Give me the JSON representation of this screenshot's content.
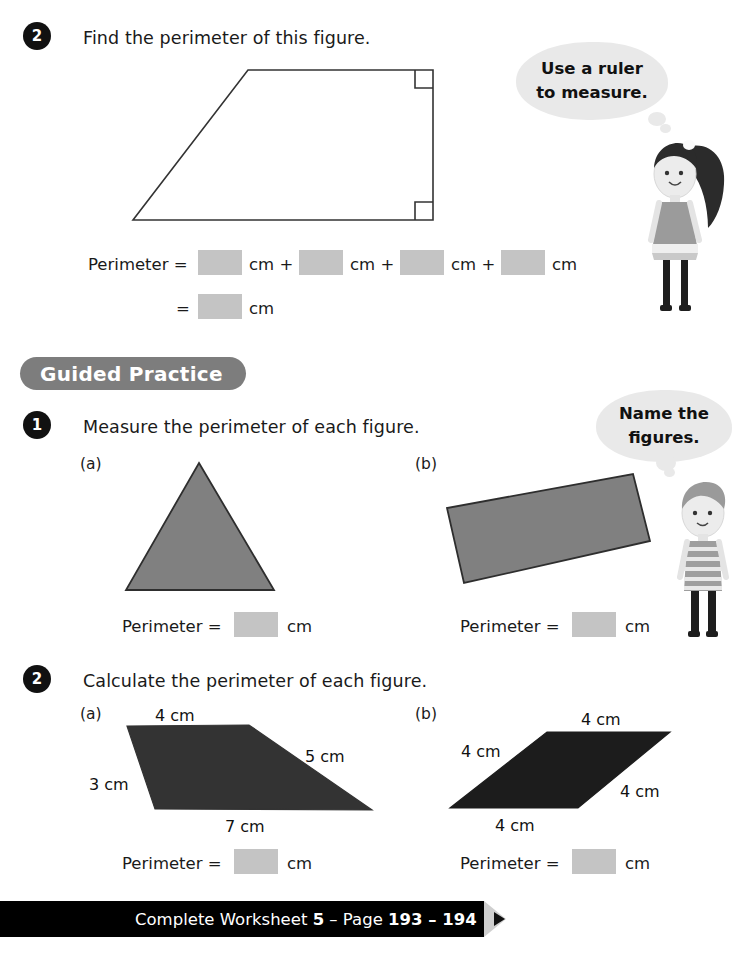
{
  "page": {
    "width": 754,
    "height": 970,
    "background": "#ffffff"
  },
  "colors": {
    "badge": "#111111",
    "pill": "#7d7d7d",
    "blank": "#c4c4c4",
    "shape_light_gray": "#808080",
    "shape_dark_gray": "#333333",
    "bubble": "#e9e9e9",
    "banner": "#000000",
    "banner_arrow": "#cfcfcf"
  },
  "question_2_top": {
    "badge": "2",
    "prompt": "Find the perimeter of this figure.",
    "figure": {
      "name": "right-trapezoid-outline",
      "fill": "none",
      "stroke": "#333333",
      "right_angle_marks": 2
    },
    "perimeter_line_1": {
      "label": "Perimeter =",
      "units": [
        "cm +",
        "cm +",
        "cm +",
        "cm"
      ],
      "blanks": 4,
      "blank_values": [
        "",
        "",
        "",
        ""
      ]
    },
    "perimeter_line_2": {
      "label": "=",
      "unit": "cm",
      "blanks": 1,
      "blank_values": [
        ""
      ]
    },
    "speech_bubble": {
      "line1": "Use a ruler",
      "line2": "to measure."
    },
    "character": "girl-with-ponytail"
  },
  "guided_practice": {
    "title": "Guided Practice"
  },
  "question_1": {
    "badge": "1",
    "prompt": "Measure the perimeter of each figure.",
    "speech_bubble": {
      "line1": "Name the",
      "line2": "figures."
    },
    "character": "boy-with-striped-shirt",
    "parts": [
      {
        "label": "(a)",
        "figure": "filled-triangle",
        "fill": "#808080",
        "perimeter_label": "Perimeter =",
        "unit": "cm",
        "blank_value": ""
      },
      {
        "label": "(b)",
        "figure": "tilted-filled-rectangle",
        "fill": "#808080",
        "perimeter_label": "Perimeter =",
        "unit": "cm",
        "blank_value": ""
      }
    ]
  },
  "question_2_bottom": {
    "badge": "2",
    "prompt": "Calculate the perimeter of each figure.",
    "parts": [
      {
        "label": "(a)",
        "figure": "filled-trapezoid",
        "fill": "#333333",
        "side_labels": {
          "top": "4 cm",
          "right": "5 cm",
          "left": "3 cm",
          "bottom": "7 cm"
        },
        "perimeter_label": "Perimeter =",
        "unit": "cm",
        "blank_value": ""
      },
      {
        "label": "(b)",
        "figure": "filled-rhombus",
        "fill": "#1c1c1c",
        "side_labels": {
          "top": "4 cm",
          "left": "4 cm",
          "right": "4 cm",
          "bottom": "4 cm"
        },
        "perimeter_label": "Perimeter =",
        "unit": "cm",
        "blank_value": ""
      }
    ]
  },
  "footer_banner": {
    "prefix": "Complete Worksheet ",
    "worksheet_number": "5",
    "separator": " – Page ",
    "pages": "193 – 194"
  }
}
